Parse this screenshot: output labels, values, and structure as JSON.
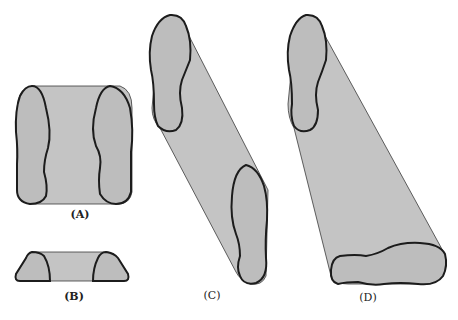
{
  "figure": {
    "panels": [
      {
        "id": "A",
        "label": "(A)",
        "description": "Prism with two foot-shaped cross-sections side by side (translation sideways)"
      },
      {
        "id": "B",
        "label": "(B)",
        "description": "Flat trapezoidal prism viewed edge-on"
      },
      {
        "id": "C",
        "label": "(C)",
        "description": "Diagonal prism connecting two parallel foot-shaped ends"
      },
      {
        "id": "D",
        "label": "(D)",
        "description": "Tapering prism from upright foot to horizontal foot cross-section"
      }
    ],
    "colors": {
      "fill": "#c4c4c4",
      "outline": "#1c1c1c",
      "background": "#ffffff"
    }
  }
}
